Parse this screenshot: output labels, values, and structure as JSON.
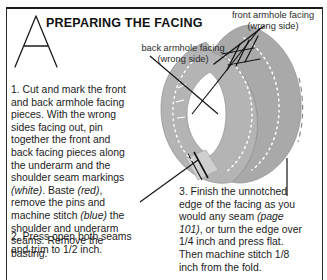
{
  "page": {
    "heading": "PREPARING THE FACING",
    "dropcap": "A"
  },
  "steps": [
    {
      "number": "1.",
      "text_parts": [
        {
          "style": "normal",
          "text": "1.  Cut and mark the front and back armhole facing pieces. With the wrong sides facing out, pin together the front and back facing pieces along the underarm and the shoulder seam markings "
        },
        {
          "style": "italic",
          "text": "(white)"
        },
        {
          "style": "normal",
          "text": ". Baste "
        },
        {
          "style": "italic",
          "text": "(red)"
        },
        {
          "style": "normal",
          "text": ", remove the pins and machine stitch "
        },
        {
          "style": "italic",
          "text": "(blue)"
        },
        {
          "style": "normal",
          "text": " the shoulder and underarm seams. Remove the basting."
        }
      ]
    },
    {
      "number": "2.",
      "text_parts": [
        {
          "style": "normal",
          "text": "2.  Press open both seams and trim to 1/2 inch."
        }
      ]
    },
    {
      "number": "3.",
      "text_parts": [
        {
          "style": "normal",
          "text": "3.  Finish the unnotched edge of the facing as you would any seam "
        },
        {
          "style": "italic",
          "text": "(page 101)"
        },
        {
          "style": "normal",
          "text": ", or turn the edge over 1/4 inch and press flat. Then machine stitch 1/8 inch from the fold."
        }
      ]
    }
  ],
  "figure": {
    "label_front_line1": "front armhole facing",
    "label_front_line2": "(wrong side)",
    "label_back_line1": "back armhole facing",
    "label_back_line2": "(wrong side)",
    "colors": {
      "fabric_gray": "#a9a9a9",
      "fabric_shadow": "#8d8d8d",
      "fabric_light": "#c9c9c9",
      "line_black": "#111111",
      "stitch_white": "#ffffff"
    }
  }
}
